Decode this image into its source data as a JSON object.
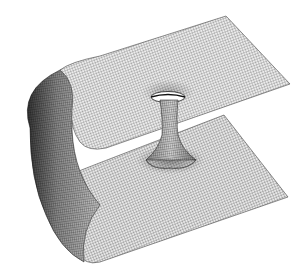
{
  "figure": {
    "description": "Wireframe mesh rendering of a folded sheet with a wormhole throat connecting upper and lower surfaces",
    "colors": {
      "background": "#ffffff",
      "surface": "#e6e6e6",
      "mesh_line": "#3a3a3a",
      "shadow": "#1e1e1e"
    }
  }
}
